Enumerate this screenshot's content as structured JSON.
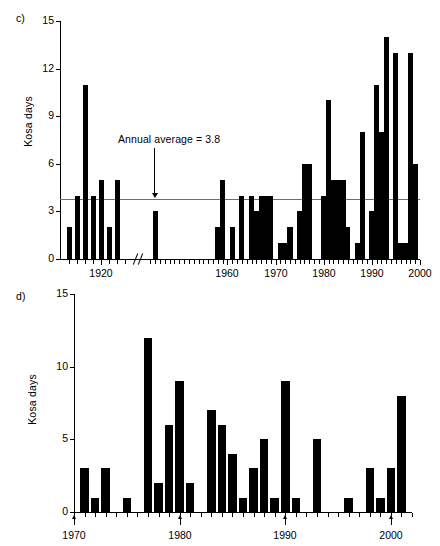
{
  "figure": {
    "panels": [
      {
        "letter": "c)",
        "ylabel": "Kosa days",
        "annotation": "Annual average = 3.8"
      },
      {
        "letter": "d)",
        "ylabel": "Kosa days"
      }
    ]
  },
  "chart_data": [
    {
      "type": "bar",
      "panel": "c",
      "title": "",
      "xlabel": "",
      "ylabel": "Kosa days",
      "ylim": [
        0,
        15
      ],
      "yticks": [
        0,
        3,
        6,
        9,
        12,
        15
      ],
      "ytick_labels": [
        "0",
        "3",
        "6",
        "9",
        "12",
        "15"
      ],
      "xlim": [
        1915,
        2000
      ],
      "xticks": [
        1920,
        1960,
        1970,
        1980,
        1990,
        2000
      ],
      "xtick_labels": [
        "1920",
        "1960",
        "1970",
        "1980",
        "1990",
        "2000"
      ],
      "axis_break": true,
      "axis_break_range": [
        1923,
        1943
      ],
      "grid": false,
      "legend": "none",
      "reference_line": {
        "label": "Annual average = 3.8",
        "value": 3.8,
        "color": "#6e6e6e"
      },
      "categories": [
        1916,
        1917,
        1918,
        1919,
        1920,
        1921,
        1922,
        1945,
        1958,
        1960,
        1962,
        1965,
        1966,
        1967,
        1968,
        1969,
        1971,
        1972,
        1973,
        1975,
        1976,
        1977,
        1980,
        1981,
        1982,
        1983,
        1984,
        1985,
        1988,
        1989,
        1990,
        1991,
        1992,
        1993,
        1995,
        1996,
        1997,
        1998,
        1999
      ],
      "values": [
        2,
        4,
        11,
        4,
        5,
        2,
        5,
        3,
        2,
        5,
        2,
        4,
        4,
        3,
        4,
        4,
        4,
        1,
        1,
        2,
        3,
        6,
        6,
        4,
        5,
        10,
        5,
        5,
        5,
        2,
        1,
        8,
        3,
        11,
        8,
        14,
        13,
        1,
        1
      ],
      "series": [
        {
          "name": "Kosa days",
          "points": [
            {
              "x": 1916,
              "y": 2
            },
            {
              "x": 1917,
              "y": 4
            },
            {
              "x": 1918,
              "y": 11
            },
            {
              "x": 1919,
              "y": 4
            },
            {
              "x": 1920,
              "y": 5
            },
            {
              "x": 1921,
              "y": 2
            },
            {
              "x": 1922,
              "y": 5
            },
            {
              "x": 1945,
              "y": 3
            },
            {
              "x": 1958,
              "y": 2
            },
            {
              "x": 1959,
              "y": 5
            },
            {
              "x": 1961,
              "y": 2
            },
            {
              "x": 1963,
              "y": 4
            },
            {
              "x": 1965,
              "y": 4
            },
            {
              "x": 1966,
              "y": 3
            },
            {
              "x": 1967,
              "y": 4
            },
            {
              "x": 1968,
              "y": 4
            },
            {
              "x": 1969,
              "y": 4
            },
            {
              "x": 1971,
              "y": 1
            },
            {
              "x": 1972,
              "y": 1
            },
            {
              "x": 1973,
              "y": 2
            },
            {
              "x": 1975,
              "y": 3
            },
            {
              "x": 1976,
              "y": 6
            },
            {
              "x": 1977,
              "y": 6
            },
            {
              "x": 1980,
              "y": 4
            },
            {
              "x": 1981,
              "y": 10
            },
            {
              "x": 1981.6,
              "y": 5
            },
            {
              "x": 1982,
              "y": 5
            },
            {
              "x": 1983,
              "y": 5
            },
            {
              "x": 1984,
              "y": 5
            },
            {
              "x": 1985,
              "y": 2
            },
            {
              "x": 1987,
              "y": 1
            },
            {
              "x": 1988,
              "y": 8
            },
            {
              "x": 1990,
              "y": 3
            },
            {
              "x": 1991,
              "y": 11
            },
            {
              "x": 1992,
              "y": 8
            },
            {
              "x": 1993,
              "y": 14
            },
            {
              "x": 1995,
              "y": 13
            },
            {
              "x": 1996,
              "y": 1
            },
            {
              "x": 1997,
              "y": 1
            },
            {
              "x": 1998,
              "y": 13
            },
            {
              "x": 1999,
              "y": 6
            }
          ]
        }
      ]
    },
    {
      "type": "bar",
      "panel": "d",
      "title": "",
      "xlabel": "",
      "ylabel": "Kosa days",
      "ylim": [
        0,
        15
      ],
      "yticks": [
        0,
        5,
        10,
        15
      ],
      "ytick_labels": [
        "0",
        "5",
        "10",
        "15"
      ],
      "xlim": [
        1970,
        2002
      ],
      "xticks": [
        1970,
        1980,
        1990,
        2000
      ],
      "xtick_labels": [
        "1970",
        "1980",
        "1990",
        "2000"
      ],
      "grid": false,
      "legend": "none",
      "categories": [
        1971,
        1972,
        1973,
        1975,
        1977,
        1978,
        1979,
        1980,
        1981,
        1983,
        1984,
        1985,
        1986,
        1987,
        1988,
        1989,
        1990,
        1991,
        1993,
        1996,
        1998,
        1999,
        2000,
        2001
      ],
      "values": [
        3,
        1,
        3,
        1,
        12,
        2,
        6,
        9,
        2,
        7,
        6,
        4,
        1,
        3,
        5,
        1,
        9,
        1,
        5,
        1,
        3,
        1,
        3,
        8
      ],
      "series": [
        {
          "name": "Kosa days",
          "points": [
            {
              "x": 1971,
              "y": 3
            },
            {
              "x": 1972,
              "y": 1
            },
            {
              "x": 1973,
              "y": 3
            },
            {
              "x": 1975,
              "y": 1
            },
            {
              "x": 1977,
              "y": 12
            },
            {
              "x": 1978,
              "y": 2
            },
            {
              "x": 1979,
              "y": 6
            },
            {
              "x": 1980,
              "y": 9
            },
            {
              "x": 1981,
              "y": 2
            },
            {
              "x": 1983,
              "y": 7
            },
            {
              "x": 1984,
              "y": 6
            },
            {
              "x": 1985,
              "y": 4
            },
            {
              "x": 1986,
              "y": 1
            },
            {
              "x": 1987,
              "y": 3
            },
            {
              "x": 1988,
              "y": 5
            },
            {
              "x": 1989,
              "y": 1
            },
            {
              "x": 1990,
              "y": 9
            },
            {
              "x": 1991,
              "y": 1
            },
            {
              "x": 1993,
              "y": 5
            },
            {
              "x": 1996,
              "y": 1
            },
            {
              "x": 1998,
              "y": 3
            },
            {
              "x": 1999,
              "y": 1
            },
            {
              "x": 2000,
              "y": 3
            },
            {
              "x": 2001,
              "y": 8
            }
          ]
        }
      ]
    }
  ]
}
